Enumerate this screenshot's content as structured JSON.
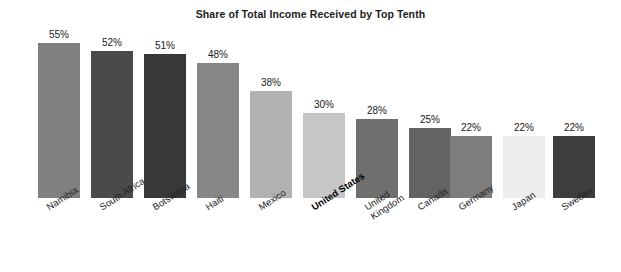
{
  "chart": {
    "title": "Share of Total Income Received by Top Tenth",
    "background_color": "#ffffff",
    "text_color": "#1c1c1c"
  },
  "chart_data": {
    "type": "bar",
    "title": "Share of Total Income Received by Top Tenth",
    "xlabel": "",
    "ylabel": "",
    "ylim": [
      0,
      60
    ],
    "grid": false,
    "legend": null,
    "value_suffix": "%",
    "categories": [
      "Namibia",
      "South Africa",
      "Botswana",
      "Haiti",
      "Mexico",
      "United States",
      "United Kingdom",
      "Canada",
      "Germany",
      "Japan",
      "Sweden"
    ],
    "values": [
      55,
      52,
      51,
      48,
      38,
      30,
      28,
      25,
      22,
      22,
      22
    ],
    "value_labels": [
      "55%",
      "52%",
      "51%",
      "48%",
      "38%",
      "30%",
      "28%",
      "25%",
      "22%",
      "22%",
      "22%"
    ],
    "bar_colors": [
      "#808080",
      "#4a4a4a",
      "#383838",
      "#878787",
      "#b2b2b2",
      "#c6c6c6",
      "#6f6f6f",
      "#636363",
      "#7d7d7d",
      "#ededed",
      "#3d3d3d"
    ],
    "highlighted_category": "United States"
  },
  "bars": [
    {
      "label": "Namibia",
      "label_display": "Namibia",
      "value": 55,
      "value_label": "55%",
      "color": "#808080",
      "x": 38,
      "width": 42,
      "highlighted": false
    },
    {
      "label": "South Africa",
      "label_display": "South Africa",
      "value": 52,
      "value_label": "52%",
      "color": "#4a4a4a",
      "x": 91,
      "width": 42,
      "highlighted": false
    },
    {
      "label": "Botswana",
      "label_display": "Botswana",
      "value": 51,
      "value_label": "51%",
      "color": "#383838",
      "x": 144,
      "width": 42,
      "highlighted": false
    },
    {
      "label": "Haiti",
      "label_display": "Haiti",
      "value": 48,
      "value_label": "48%",
      "color": "#878787",
      "x": 197,
      "width": 42,
      "highlighted": false
    },
    {
      "label": "Mexico",
      "label_display": "Mexico",
      "value": 38,
      "value_label": "38%",
      "color": "#b2b2b2",
      "x": 250,
      "width": 42,
      "highlighted": false
    },
    {
      "label": "United States",
      "label_display": "United States",
      "value": 30,
      "value_label": "30%",
      "color": "#c6c6c6",
      "x": 303,
      "width": 42,
      "highlighted": true
    },
    {
      "label": "United Kingdom",
      "label_display": "United\nKingdom",
      "value": 28,
      "value_label": "28%",
      "color": "#6f6f6f",
      "x": 356,
      "width": 42,
      "highlighted": false
    },
    {
      "label": "Canada",
      "label_display": "Canada",
      "value": 25,
      "value_label": "25%",
      "color": "#636363",
      "x": 409,
      "width": 42,
      "highlighted": false
    },
    {
      "label": "Germany",
      "label_display": "Germany",
      "value": 22,
      "value_label": "22%",
      "color": "#7d7d7d",
      "x": 450,
      "width": 42,
      "highlighted": false
    },
    {
      "label": "Japan",
      "label_display": "Japan",
      "value": 22,
      "value_label": "22%",
      "color": "#ededed",
      "x": 503,
      "width": 42,
      "highlighted": false
    },
    {
      "label": "Sweden",
      "label_display": "Sweden",
      "value": 22,
      "value_label": "22%",
      "color": "#3d3d3d",
      "x": 553,
      "width": 42,
      "highlighted": false
    }
  ],
  "geometry": {
    "baseline_y": 198,
    "px_per_unit": 2.82,
    "label_offset_above_bar": 14
  }
}
